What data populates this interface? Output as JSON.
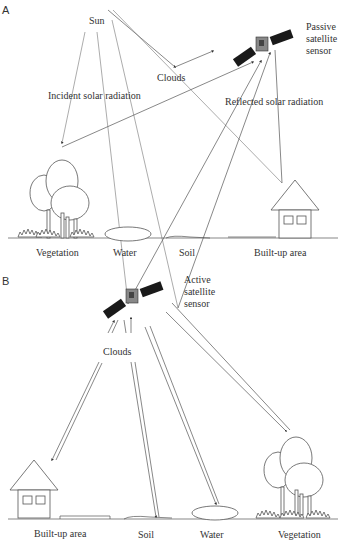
{
  "panels": [
    {
      "id": "A",
      "label": "A",
      "sensor_label": [
        "Passive",
        "satellite",
        "sensor"
      ],
      "source_label": "Sun",
      "clouds_label": "Clouds",
      "incident_label": "Incident solar radiation",
      "reflected_label": "Reflected solar radiation",
      "targets": [
        "Vegetation",
        "Water",
        "Soil",
        "Built-up area"
      ]
    },
    {
      "id": "B",
      "label": "B",
      "sensor_label": [
        "Active",
        "satellite",
        "sensor"
      ],
      "clouds_label": "Clouds",
      "targets": [
        "Built-up area",
        "Soil",
        "Water",
        "Vegetation"
      ]
    }
  ],
  "colors": {
    "line": "#555555",
    "light_line": "#888888",
    "panel_black": "#1a1a1a",
    "background": "#ffffff"
  }
}
